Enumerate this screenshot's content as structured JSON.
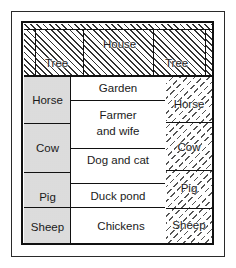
{
  "diagram": {
    "top_row": {
      "left_tree": "Tree",
      "house": "House",
      "right_tree": "Tree"
    },
    "left_column": [
      "Horse",
      "Cow",
      "Pig",
      "Sheep"
    ],
    "center_column": [
      "Garden",
      "Farmer and wife",
      "Dog and cat",
      "Duck pond",
      "Chickens"
    ],
    "center_column_lines": {
      "farmer_line1": "Farmer",
      "farmer_line2": "and wife"
    },
    "right_column": [
      "Horse",
      "Cow",
      "Pig",
      "Sheep"
    ],
    "fills": {
      "top_row": "diagonal-hatch",
      "left_column": "light-gray-stipple",
      "center_column": "white",
      "right_column": "dashed-crosshatch"
    },
    "colors": {
      "line": "#111111",
      "stipple": "#ececec",
      "background": "#ffffff"
    }
  }
}
